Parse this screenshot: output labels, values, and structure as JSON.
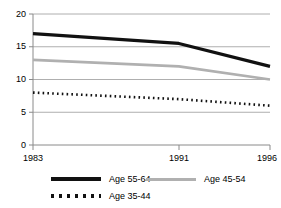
{
  "chart_data": {
    "type": "line",
    "title": "",
    "subtitle": "",
    "xlabel": "",
    "ylabel": "",
    "x": [
      1983,
      1991,
      1996
    ],
    "categories": [
      "1983",
      "1991",
      "1996"
    ],
    "xtick_labels": [
      "1983",
      "1991",
      "1996"
    ],
    "ytick_labels": [
      "0",
      "5",
      "10",
      "15",
      "20"
    ],
    "yticks": [
      0,
      5,
      10,
      15,
      20
    ],
    "ylim": [
      0,
      20
    ],
    "xlim": [
      1983,
      1996
    ],
    "grid": "horizontal",
    "legend_position": "bottom",
    "series": [
      {
        "name": "Age 55-64",
        "values": [
          17,
          15.5,
          12
        ],
        "color": "#111111",
        "style": "solid-thick"
      },
      {
        "name": "Age 45-54",
        "values": [
          13,
          12,
          10
        ],
        "color": "#b0b0b0",
        "style": "solid"
      },
      {
        "name": "Age 35-44",
        "values": [
          8,
          7,
          6
        ],
        "color": "#111111",
        "style": "dotted"
      }
    ],
    "annotations": []
  },
  "axis": {
    "y_labels": [
      "20",
      "15",
      "10",
      "5",
      "0"
    ],
    "x_labels": [
      "1983",
      "1991",
      "1996"
    ]
  },
  "legend": {
    "entries": [
      {
        "label": "Age 55-64",
        "swatch": "solid-black-line-icon"
      },
      {
        "label": "Age 45-54",
        "swatch": "solid-gray-line-icon"
      },
      {
        "label": "Age 35-44",
        "swatch": "dotted-black-line-icon"
      }
    ]
  },
  "colors": {
    "series_1": "#111111",
    "series_2": "#b0b0b0",
    "series_3": "#111111",
    "grid": "#9a9a9a",
    "axis": "#808080",
    "background": "#ffffff"
  }
}
